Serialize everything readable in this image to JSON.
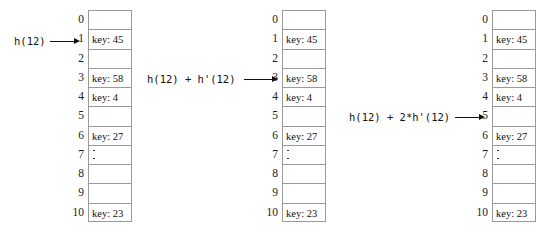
{
  "figure": {
    "slot_count": 11,
    "indices": [
      "0",
      "1",
      "2",
      "3",
      "4",
      "5",
      "6",
      "7",
      "8",
      "9",
      "10"
    ]
  },
  "tables": [
    {
      "name": "table-first-probe",
      "slots": [
        {
          "index": "0",
          "text": "",
          "kind": "empty"
        },
        {
          "index": "1",
          "text": "key: 45",
          "kind": "filled"
        },
        {
          "index": "2",
          "text": "",
          "kind": "empty"
        },
        {
          "index": "3",
          "text": "key: 58",
          "kind": "filled"
        },
        {
          "index": "4",
          "text": "key: 4",
          "kind": "filled"
        },
        {
          "index": "5",
          "text": "",
          "kind": "empty"
        },
        {
          "index": "6",
          "text": "key: 27",
          "kind": "filled"
        },
        {
          "index": "7",
          "text": "",
          "kind": "dots"
        },
        {
          "index": "8",
          "text": "",
          "kind": "empty"
        },
        {
          "index": "9",
          "text": "",
          "kind": "empty"
        },
        {
          "index": "10",
          "text": "key: 23",
          "kind": "filled"
        }
      ]
    },
    {
      "name": "table-second-probe",
      "slots": [
        {
          "index": "0",
          "text": "",
          "kind": "empty"
        },
        {
          "index": "1",
          "text": "key: 45",
          "kind": "filled"
        },
        {
          "index": "2",
          "text": "",
          "kind": "empty"
        },
        {
          "index": "3",
          "text": "key: 58",
          "kind": "filled"
        },
        {
          "index": "4",
          "text": "key: 4",
          "kind": "filled"
        },
        {
          "index": "5",
          "text": "",
          "kind": "empty"
        },
        {
          "index": "6",
          "text": "key: 27",
          "kind": "filled"
        },
        {
          "index": "7",
          "text": "",
          "kind": "dots"
        },
        {
          "index": "8",
          "text": "",
          "kind": "empty"
        },
        {
          "index": "9",
          "text": "",
          "kind": "empty"
        },
        {
          "index": "10",
          "text": "key: 23",
          "kind": "filled"
        }
      ]
    },
    {
      "name": "table-third-probe",
      "slots": [
        {
          "index": "0",
          "text": "",
          "kind": "empty"
        },
        {
          "index": "1",
          "text": "key: 45",
          "kind": "filled"
        },
        {
          "index": "2",
          "text": "",
          "kind": "empty"
        },
        {
          "index": "3",
          "text": "key: 58",
          "kind": "filled"
        },
        {
          "index": "4",
          "text": "key: 4",
          "kind": "filled"
        },
        {
          "index": "5",
          "text": "",
          "kind": "empty"
        },
        {
          "index": "6",
          "text": "key: 27",
          "kind": "filled"
        },
        {
          "index": "7",
          "text": "",
          "kind": "dots"
        },
        {
          "index": "8",
          "text": "",
          "kind": "empty"
        },
        {
          "index": "9",
          "text": "",
          "kind": "empty"
        },
        {
          "index": "10",
          "text": "key: 23",
          "kind": "filled"
        }
      ]
    }
  ],
  "probes": [
    {
      "name": "probe-1",
      "label": "h(12)",
      "target_index": "1"
    },
    {
      "name": "probe-2",
      "label": "h(12) + h'(12)",
      "target_index": "3"
    },
    {
      "name": "probe-3",
      "label": "h(12) + 2*h'(12)",
      "target_index": "5"
    }
  ]
}
